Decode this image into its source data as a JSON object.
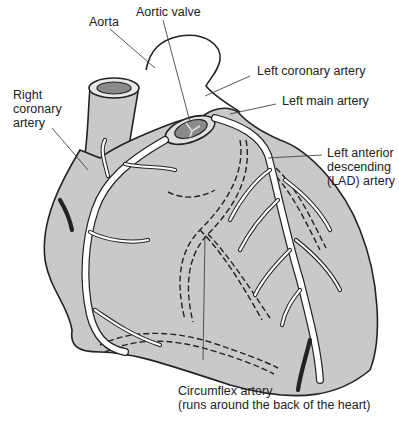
{
  "diagram": {
    "colors": {
      "heart_fill": "#c9c9c9",
      "outline": "#222222",
      "artery_fill": "#ffffff",
      "background": "#ffffff"
    },
    "labels": {
      "aorta": "Aorta",
      "aortic_valve": "Aortic valve",
      "left_coronary_artery": "Left coronary artery",
      "left_main_artery": "Left main artery",
      "right_coronary_artery": "Right\ncoronary\nartery",
      "lad_artery": "Left anterior\ndescending\n(LAD) artery",
      "circumflex_artery": "Circumflex artery\n(runs around the back of the heart)"
    }
  }
}
